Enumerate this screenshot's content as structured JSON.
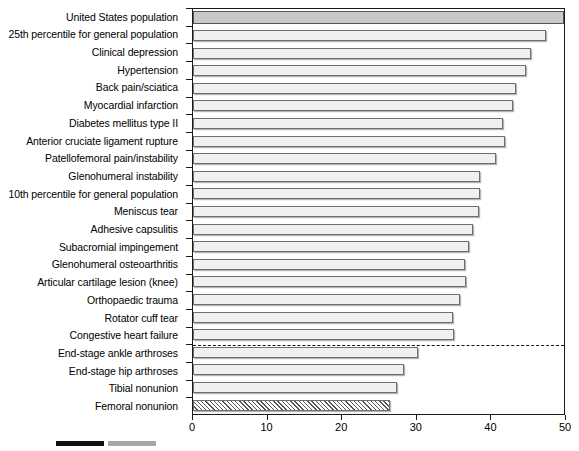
{
  "chart_data": {
    "type": "bar",
    "orientation": "horizontal",
    "title": "",
    "xlabel": "",
    "ylabel": "",
    "xlim": [
      0,
      50
    ],
    "ylim": [
      0,
      22
    ],
    "grid": false,
    "legend_position": "bottom-left",
    "xticks": [
      0,
      10,
      20,
      30,
      40,
      50
    ],
    "xtick_labels": [
      "0",
      "10",
      "20",
      "30",
      "40",
      "50"
    ],
    "categories": [
      "United States population",
      "25th percentile for general population",
      "Clinical depression",
      "Hypertension",
      "Back pain/sciatica",
      "Myocardial infarction",
      "Diabetes mellitus type II",
      "Anterior cruciate ligament rupture",
      "Patellofemoral pain/instability",
      "Glenohumeral instability",
      "10th percentile for general population",
      "Meniscus tear",
      "Adhesive capsulitis",
      "Subacromial impingement",
      "Glenohumeral osteoarthritis",
      "Articular cartilage lesion (knee)",
      "Orthopaedic trauma",
      "Rotator cuff tear",
      "Congestive heart failure",
      "End-stage ankle arthroses",
      "End-stage hip arthroses",
      "Tibial nonunion",
      "Femoral nonunion"
    ],
    "values": [
      50.0,
      47.3,
      45.3,
      44.6,
      43.3,
      42.9,
      41.5,
      41.8,
      40.6,
      38.5,
      38.5,
      38.4,
      37.6,
      37.0,
      36.4,
      36.6,
      35.8,
      34.8,
      35.0,
      30.1,
      28.3,
      27.4,
      26.4
    ],
    "bar_styles": [
      "dark",
      "light",
      "light",
      "light",
      "light",
      "light",
      "light",
      "light",
      "light",
      "light",
      "light",
      "light",
      "light",
      "light",
      "light",
      "light",
      "light",
      "light",
      "light",
      "light",
      "light",
      "light",
      "hatch"
    ],
    "annotations": [
      {
        "type": "dashed-horizontal-separator",
        "after_category": "Congestive heart failure",
        "note": "dashed line separating general/medical conditions from end-stage orthopaedic conditions"
      }
    ]
  },
  "legend": {
    "entries": [
      {
        "swatch": "solid-dark",
        "label": ""
      },
      {
        "swatch": "solid-gray",
        "label": ""
      }
    ]
  }
}
